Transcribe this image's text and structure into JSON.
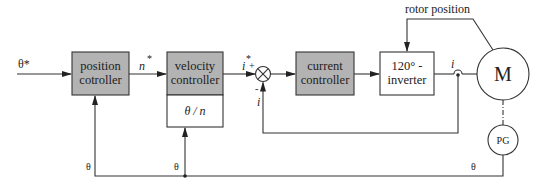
{
  "diagram": {
    "type": "block-diagram",
    "title": "",
    "colors": {
      "controller_fill": "#b3b3b3",
      "stroke": "#333333",
      "background": "#ffffff"
    },
    "input": {
      "label": "θ*"
    },
    "blocks": {
      "position_controller": {
        "line1": "position",
        "line2": "cotroller"
      },
      "velocity_controller": {
        "line1": "velocity",
        "line2": "controller",
        "sub_label": "θ / n"
      },
      "current_controller": {
        "line1": "current",
        "line2": "controller"
      },
      "inverter": {
        "line1": "120° -",
        "line2": "inverter"
      },
      "motor": {
        "label": "M"
      },
      "pulse_generator": {
        "label": "PG"
      }
    },
    "summing_junction": {
      "plus": "+",
      "minus": "-"
    },
    "signals": {
      "speed_ref": {
        "base": "n",
        "sup": "*"
      },
      "current_ref": {
        "base": "i",
        "sup": "*"
      },
      "current_out": "i",
      "current_feedback": "i",
      "rotor_position": "rotor position",
      "theta_position_fb": "θ",
      "theta_velocity_fb": "θ",
      "theta_pg": "θ"
    }
  }
}
